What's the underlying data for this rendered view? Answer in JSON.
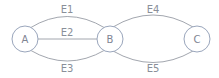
{
  "nodes": [
    {
      "id": "A",
      "label": "A"
    },
    {
      "id": "B",
      "label": "B"
    },
    {
      "id": "C",
      "label": "C"
    }
  ],
  "edges": [
    {
      "id": "E1",
      "label": "E1",
      "from": "A",
      "to": "B"
    },
    {
      "id": "E2",
      "label": "E2",
      "from": "A",
      "to": "B"
    },
    {
      "id": "E3",
      "label": "E3",
      "from": "A",
      "to": "B"
    },
    {
      "id": "E4",
      "label": "E4",
      "from": "B",
      "to": "C"
    },
    {
      "id": "E5",
      "label": "E5",
      "from": "B",
      "to": "C"
    }
  ],
  "colors": {
    "node_stroke": "#9aa6bc",
    "edge_stroke": "#8a8f99",
    "text": "#8a8f99"
  }
}
